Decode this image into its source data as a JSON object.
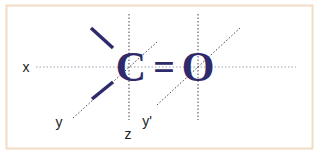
{
  "diagram": {
    "molecule": {
      "atom_left": "C",
      "bond": "=",
      "atom_right": "O",
      "color": "#2e2a6b"
    },
    "axes": {
      "x_label": "x",
      "y_label": "y",
      "z_label": "z",
      "y_prime_label": "y'"
    },
    "frame": {
      "border_color": "#f3dcc6",
      "background": "#ffffff"
    },
    "guide_color": "#555555"
  }
}
